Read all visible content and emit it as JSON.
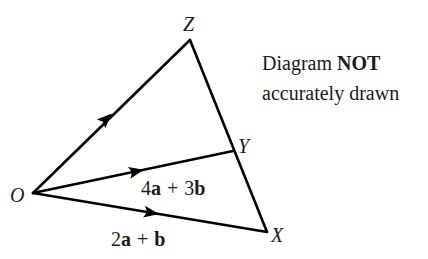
{
  "diagram": {
    "type": "vector-triangle",
    "vertices": {
      "O": {
        "label": "O",
        "x": 33,
        "y": 193
      },
      "Z": {
        "label": "Z",
        "x": 190,
        "y": 40
      },
      "Y": {
        "label": "Y",
        "x": 233,
        "y": 151
      },
      "X": {
        "label": "X",
        "x": 267,
        "y": 232
      }
    },
    "edges": [
      {
        "from": "O",
        "to": "Z",
        "arrow": true
      },
      {
        "from": "O",
        "to": "Y",
        "arrow": true
      },
      {
        "from": "O",
        "to": "X",
        "arrow": true
      },
      {
        "from": "Z",
        "to": "X",
        "arrow": false
      }
    ],
    "vectors": {
      "OY": {
        "coef1": "4",
        "var1": "a",
        "op": "+",
        "coef2": "3",
        "var2": "b"
      },
      "OX": {
        "coef1": "2",
        "var1": "a",
        "op": "+",
        "coef2": "",
        "var2": "b"
      }
    },
    "note": {
      "line1_prefix": "Diagram ",
      "line1_bold": "NOT",
      "line2": "accurately drawn"
    },
    "colors": {
      "stroke": "#000000",
      "text": "#1a1a1a",
      "background": "#ffffff"
    }
  }
}
